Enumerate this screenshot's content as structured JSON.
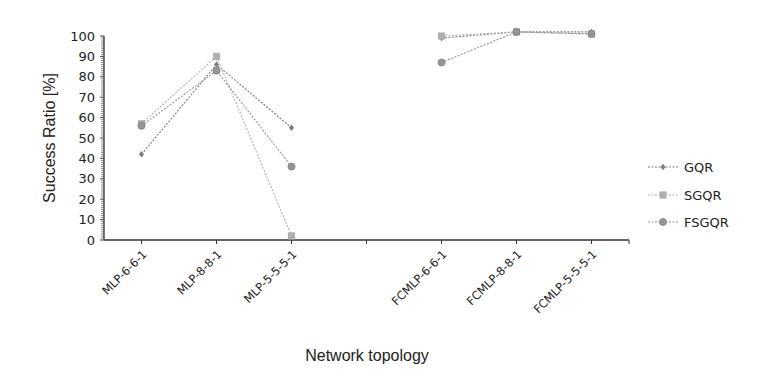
{
  "chart_data": {
    "type": "line",
    "title": "",
    "xlabel": "Network topology",
    "ylabel": "Success Ratio [%]",
    "ylim": [
      0,
      100
    ],
    "yticks": [
      0,
      10,
      20,
      30,
      40,
      50,
      60,
      70,
      80,
      90,
      100
    ],
    "grid": false,
    "legend_position": "right",
    "categories": [
      "MLP-6-6-1",
      "MLP-8-8-1",
      "MLP-5-5-5-1",
      "",
      "FCMLP-6-6-1",
      "FCMLP-8-8-1",
      "FCMLP-5-5-5-1"
    ],
    "series": [
      {
        "name": "GQR",
        "marker": "diamond",
        "color": "#7d7d7d",
        "values": [
          42,
          86,
          55,
          null,
          99,
          102,
          102
        ]
      },
      {
        "name": "SGQR",
        "marker": "square",
        "color": "#b0b0b0",
        "values": [
          57,
          90,
          2,
          null,
          100,
          102,
          101
        ]
      },
      {
        "name": "FSGQR",
        "marker": "circle",
        "color": "#959595",
        "values": [
          56,
          83,
          36,
          null,
          87,
          102,
          101
        ]
      }
    ]
  }
}
